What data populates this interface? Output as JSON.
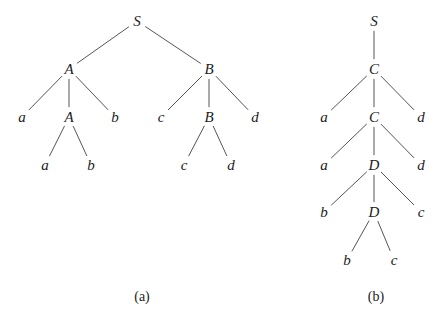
{
  "colors": {
    "line": "#555555",
    "text": "#222222",
    "background": "#ffffff"
  },
  "trees": [
    {
      "id": "a",
      "caption": "(a)",
      "caption_pos": [
        142,
        297
      ],
      "nodes": [
        {
          "label": "S",
          "x": 137,
          "y": 21
        },
        {
          "label": "A",
          "x": 69,
          "y": 69
        },
        {
          "label": "B",
          "x": 209,
          "y": 69
        },
        {
          "label": "a",
          "x": 22,
          "y": 117
        },
        {
          "label": "A",
          "x": 69,
          "y": 117
        },
        {
          "label": "b",
          "x": 115,
          "y": 117
        },
        {
          "label": "c",
          "x": 161,
          "y": 117
        },
        {
          "label": "B",
          "x": 209,
          "y": 117
        },
        {
          "label": "d",
          "x": 255,
          "y": 117
        },
        {
          "label": "a",
          "x": 45,
          "y": 165
        },
        {
          "label": "b",
          "x": 91,
          "y": 165
        },
        {
          "label": "c",
          "x": 184,
          "y": 165
        },
        {
          "label": "d",
          "x": 231,
          "y": 165
        }
      ],
      "edges": [
        [
          0,
          1
        ],
        [
          0,
          2
        ],
        [
          1,
          3
        ],
        [
          1,
          4
        ],
        [
          1,
          5
        ],
        [
          2,
          6
        ],
        [
          2,
          7
        ],
        [
          2,
          8
        ],
        [
          4,
          9
        ],
        [
          4,
          10
        ],
        [
          7,
          11
        ],
        [
          7,
          12
        ]
      ]
    },
    {
      "id": "b",
      "caption": "(b)",
      "caption_pos": [
        376,
        297
      ],
      "nodes": [
        {
          "label": "S",
          "x": 374,
          "y": 21
        },
        {
          "label": "C",
          "x": 374,
          "y": 69
        },
        {
          "label": "a",
          "x": 324,
          "y": 117
        },
        {
          "label": "C",
          "x": 374,
          "y": 117
        },
        {
          "label": "d",
          "x": 421,
          "y": 117
        },
        {
          "label": "a",
          "x": 324,
          "y": 165
        },
        {
          "label": "D",
          "x": 374,
          "y": 165
        },
        {
          "label": "d",
          "x": 421,
          "y": 165
        },
        {
          "label": "b",
          "x": 324,
          "y": 212
        },
        {
          "label": "D",
          "x": 374,
          "y": 212
        },
        {
          "label": "c",
          "x": 421,
          "y": 212
        },
        {
          "label": "b",
          "x": 347,
          "y": 260
        },
        {
          "label": "c",
          "x": 394,
          "y": 260
        }
      ],
      "edges": [
        [
          0,
          1
        ],
        [
          1,
          2
        ],
        [
          1,
          3
        ],
        [
          1,
          4
        ],
        [
          3,
          5
        ],
        [
          3,
          6
        ],
        [
          3,
          7
        ],
        [
          6,
          8
        ],
        [
          6,
          9
        ],
        [
          6,
          10
        ],
        [
          9,
          11
        ],
        [
          9,
          12
        ]
      ]
    }
  ]
}
